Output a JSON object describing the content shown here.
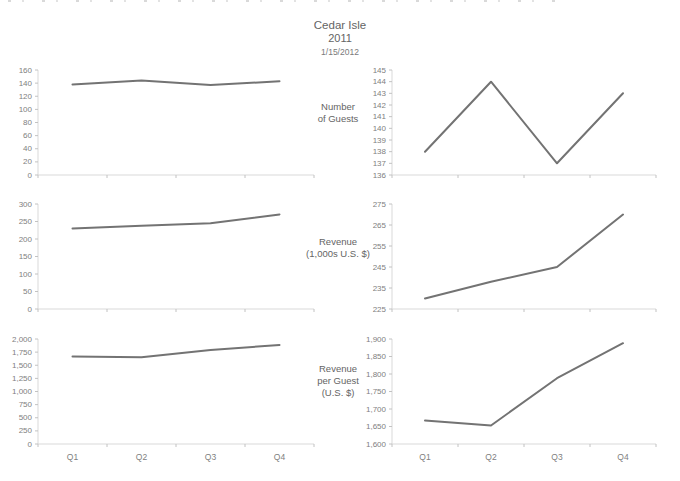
{
  "header": {
    "title": "Cedar Isle",
    "year": "2011",
    "date": "1/15/2012"
  },
  "rows": [
    {
      "label": "Number\nof Guests"
    },
    {
      "label": "Revenue\n(1,000s U.S. $)"
    },
    {
      "label": "Revenue\nper Guest\n(U.S. $)"
    }
  ],
  "colors": {
    "line": "#737373",
    "axis": "#d9d9d9",
    "tick": "#c2c2c2",
    "tick_text": "#808080",
    "label_text": "#646464"
  },
  "chart_data": [
    {
      "id": "number-of-guests-zero-baseline",
      "type": "line",
      "series_name": "Number of Guests",
      "categories": [
        "Q1",
        "Q2",
        "Q3",
        "Q4"
      ],
      "values": [
        138,
        144,
        137,
        143
      ],
      "ylim": [
        0,
        160
      ],
      "ytick_step": 20,
      "show_x_labels": false,
      "grid": false,
      "legend": "none"
    },
    {
      "id": "number-of-guests-zoomed",
      "type": "line",
      "series_name": "Number of Guests",
      "categories": [
        "Q1",
        "Q2",
        "Q3",
        "Q4"
      ],
      "values": [
        138,
        144,
        137,
        143
      ],
      "ylim": [
        136,
        145
      ],
      "ytick_step": 1,
      "show_x_labels": false,
      "grid": false,
      "legend": "none"
    },
    {
      "id": "revenue-zero-baseline",
      "type": "line",
      "series_name": "Revenue (1,000s U.S. $)",
      "categories": [
        "Q1",
        "Q2",
        "Q3",
        "Q4"
      ],
      "values": [
        230,
        238,
        245,
        270
      ],
      "ylim": [
        0,
        300
      ],
      "ytick_step": 50,
      "show_x_labels": false,
      "grid": false,
      "legend": "none"
    },
    {
      "id": "revenue-zoomed",
      "type": "line",
      "series_name": "Revenue (1,000s U.S. $)",
      "categories": [
        "Q1",
        "Q2",
        "Q3",
        "Q4"
      ],
      "values": [
        230,
        238,
        245,
        270
      ],
      "ylim": [
        225,
        275
      ],
      "ytick_step": 10,
      "show_x_labels": false,
      "grid": false,
      "legend": "none"
    },
    {
      "id": "revenue-per-guest-zero-baseline",
      "type": "line",
      "series_name": "Revenue per Guest (U.S. $)",
      "categories": [
        "Q1",
        "Q2",
        "Q3",
        "Q4"
      ],
      "values": [
        1667,
        1653,
        1788,
        1888
      ],
      "ylim": [
        0,
        2000
      ],
      "ytick_step": 250,
      "show_x_labels": true,
      "grid": false,
      "legend": "none"
    },
    {
      "id": "revenue-per-guest-zoomed",
      "type": "line",
      "series_name": "Revenue per Guest (U.S. $)",
      "categories": [
        "Q1",
        "Q2",
        "Q3",
        "Q4"
      ],
      "values": [
        1667,
        1653,
        1788,
        1888
      ],
      "ylim": [
        1600,
        1900
      ],
      "ytick_step": 50,
      "show_x_labels": true,
      "grid": false,
      "legend": "none"
    }
  ]
}
